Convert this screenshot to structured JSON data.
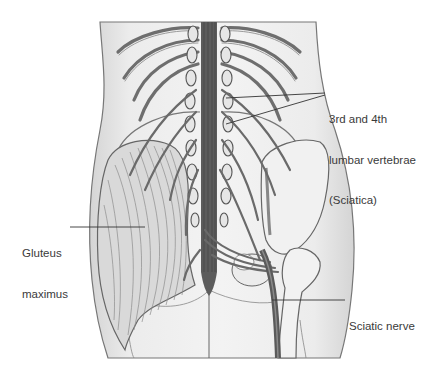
{
  "diagram": {
    "type": "anatomical-illustration",
    "labels": [
      {
        "id": "lumbar",
        "lines": [
          "3rd and 4th",
          "lumbar vertebrae",
          "(Sciatica)"
        ],
        "x": 329,
        "y": 90
      },
      {
        "id": "gluteus",
        "lines": [
          "Gluteus",
          "maximus"
        ],
        "x": 24,
        "y": 220
      },
      {
        "id": "sciatic",
        "lines": [
          "Sciatic nerve"
        ],
        "x": 349,
        "y": 295
      }
    ],
    "colors": {
      "background": "#ffffff",
      "skin": "#e8e8e8",
      "outline": "#555555",
      "nerve": "#6a6a6a",
      "spinal_cord": "#5a5a5a",
      "bone": "#efefef",
      "muscle": "#d6d6d6",
      "label_text": "#3a3a3a",
      "leader_line": "#333333"
    }
  }
}
